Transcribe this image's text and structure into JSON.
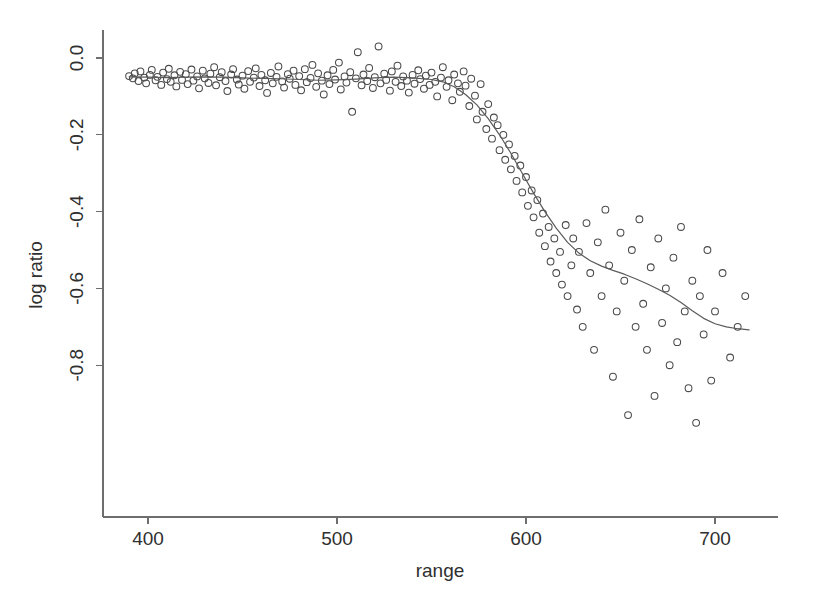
{
  "chart_data": {
    "type": "scatter",
    "title": "",
    "xlabel": "range",
    "ylabel": "log ratio",
    "xlim": [
      383,
      725
    ],
    "ylim": [
      -0.99,
      0.07
    ],
    "xticks": [
      400,
      500,
      600,
      700
    ],
    "xticklabels": [
      "400",
      "500",
      "600",
      "700"
    ],
    "yticks": [
      0.0,
      -0.2,
      -0.4,
      -0.6,
      -0.8
    ],
    "yticklabels": [
      "0.0",
      "-0.2",
      "-0.4",
      "-0.6",
      "-0.8"
    ],
    "grid": false,
    "legend": null,
    "marker": "open-circle",
    "marker_color": "#4a4a4a",
    "line_color": "#5a5a5a",
    "background": "#ffffff",
    "series": [
      {
        "name": "observations",
        "type": "scatter",
        "x": [
          390,
          392,
          393,
          395,
          396,
          398,
          399,
          401,
          402,
          404,
          405,
          407,
          408,
          410,
          411,
          412,
          414,
          415,
          417,
          418,
          420,
          421,
          423,
          424,
          426,
          427,
          429,
          430,
          432,
          433,
          435,
          436,
          438,
          439,
          441,
          442,
          444,
          445,
          447,
          448,
          450,
          451,
          453,
          454,
          456,
          457,
          459,
          460,
          462,
          463,
          465,
          466,
          468,
          469,
          471,
          472,
          474,
          475,
          477,
          478,
          480,
          481,
          483,
          484,
          486,
          487,
          489,
          490,
          492,
          493,
          495,
          496,
          498,
          499,
          501,
          502,
          504,
          505,
          507,
          508,
          510,
          511,
          513,
          514,
          516,
          517,
          519,
          520,
          522,
          523,
          525,
          526,
          528,
          529,
          531,
          532,
          534,
          535,
          537,
          538,
          540,
          541,
          543,
          544,
          546,
          547,
          549,
          550,
          552,
          553,
          555,
          556,
          558,
          559,
          561,
          562,
          564,
          565,
          567,
          568,
          570,
          571,
          573,
          574,
          576,
          577,
          579,
          580,
          582,
          583,
          585,
          586,
          588,
          589,
          591,
          592,
          594,
          595,
          597,
          598,
          600,
          601,
          603,
          604,
          606,
          607,
          609,
          610,
          612,
          613,
          615,
          616,
          618,
          619,
          621,
          622,
          624,
          625,
          627,
          628,
          630,
          632,
          634,
          636,
          638,
          640,
          642,
          644,
          646,
          648,
          650,
          652,
          654,
          656,
          658,
          660,
          662,
          664,
          666,
          668,
          670,
          672,
          674,
          676,
          678,
          680,
          682,
          684,
          686,
          688,
          690,
          692,
          694,
          696,
          698,
          700,
          704,
          708,
          712,
          716
        ],
        "y": [
          -0.047,
          -0.053,
          -0.04,
          -0.06,
          -0.035,
          -0.051,
          -0.066,
          -0.044,
          -0.031,
          -0.058,
          -0.049,
          -0.07,
          -0.038,
          -0.055,
          -0.028,
          -0.062,
          -0.045,
          -0.074,
          -0.036,
          -0.057,
          -0.042,
          -0.068,
          -0.03,
          -0.059,
          -0.048,
          -0.079,
          -0.033,
          -0.053,
          -0.065,
          -0.041,
          -0.024,
          -0.071,
          -0.05,
          -0.037,
          -0.06,
          -0.086,
          -0.043,
          -0.029,
          -0.056,
          -0.069,
          -0.046,
          -0.08,
          -0.034,
          -0.062,
          -0.051,
          -0.027,
          -0.073,
          -0.044,
          -0.058,
          -0.091,
          -0.039,
          -0.066,
          -0.049,
          -0.022,
          -0.061,
          -0.077,
          -0.042,
          -0.054,
          -0.033,
          -0.07,
          -0.047,
          -0.084,
          -0.029,
          -0.063,
          -0.052,
          -0.018,
          -0.075,
          -0.04,
          -0.059,
          -0.095,
          -0.045,
          -0.068,
          -0.031,
          -0.056,
          -0.012,
          -0.082,
          -0.048,
          -0.064,
          -0.037,
          -0.14,
          -0.053,
          0.015,
          -0.071,
          -0.043,
          -0.06,
          -0.026,
          -0.078,
          -0.05,
          0.03,
          -0.066,
          -0.041,
          -0.057,
          -0.085,
          -0.035,
          -0.062,
          -0.02,
          -0.073,
          -0.048,
          -0.059,
          -0.09,
          -0.044,
          -0.067,
          -0.032,
          -0.055,
          -0.08,
          -0.046,
          -0.07,
          -0.038,
          -0.062,
          -0.1,
          -0.051,
          -0.024,
          -0.075,
          -0.058,
          -0.11,
          -0.043,
          -0.066,
          -0.088,
          -0.035,
          -0.072,
          -0.125,
          -0.054,
          -0.098,
          -0.16,
          -0.068,
          -0.14,
          -0.185,
          -0.12,
          -0.21,
          -0.155,
          -0.175,
          -0.24,
          -0.2,
          -0.265,
          -0.225,
          -0.29,
          -0.255,
          -0.32,
          -0.28,
          -0.35,
          -0.31,
          -0.385,
          -0.345,
          -0.415,
          -0.37,
          -0.455,
          -0.405,
          -0.49,
          -0.44,
          -0.53,
          -0.47,
          -0.56,
          -0.505,
          -0.59,
          -0.435,
          -0.62,
          -0.54,
          -0.47,
          -0.655,
          -0.505,
          -0.7,
          -0.43,
          -0.56,
          -0.76,
          -0.48,
          -0.62,
          -0.395,
          -0.54,
          -0.83,
          -0.66,
          -0.455,
          -0.58,
          -0.93,
          -0.5,
          -0.7,
          -0.42,
          -0.64,
          -0.76,
          -0.545,
          -0.88,
          -0.47,
          -0.69,
          -0.6,
          -0.8,
          -0.52,
          -0.74,
          -0.44,
          -0.66,
          -0.86,
          -0.58,
          -0.95,
          -0.62,
          -0.72,
          -0.5,
          -0.84,
          -0.66,
          -0.56,
          -0.78,
          -0.7,
          -0.62
        ]
      },
      {
        "name": "loess-fit",
        "type": "line",
        "x": [
          390,
          400,
          410,
          420,
          430,
          440,
          450,
          460,
          470,
          480,
          490,
          500,
          510,
          520,
          530,
          540,
          550,
          556,
          562,
          568,
          574,
          580,
          586,
          592,
          598,
          604,
          610,
          616,
          622,
          628,
          634,
          640,
          646,
          652,
          658,
          664,
          670,
          676,
          682,
          688,
          694,
          700,
          706,
          712,
          718
        ],
        "y": [
          -0.049,
          -0.05,
          -0.051,
          -0.05,
          -0.049,
          -0.05,
          -0.052,
          -0.053,
          -0.054,
          -0.056,
          -0.058,
          -0.057,
          -0.055,
          -0.052,
          -0.05,
          -0.052,
          -0.056,
          -0.062,
          -0.075,
          -0.095,
          -0.122,
          -0.158,
          -0.2,
          -0.248,
          -0.3,
          -0.352,
          -0.4,
          -0.443,
          -0.48,
          -0.508,
          -0.528,
          -0.542,
          -0.553,
          -0.563,
          -0.575,
          -0.588,
          -0.602,
          -0.618,
          -0.637,
          -0.658,
          -0.678,
          -0.692,
          -0.7,
          -0.705,
          -0.708
        ]
      }
    ]
  },
  "axes": {
    "x_title": "range",
    "y_title": "log ratio"
  }
}
